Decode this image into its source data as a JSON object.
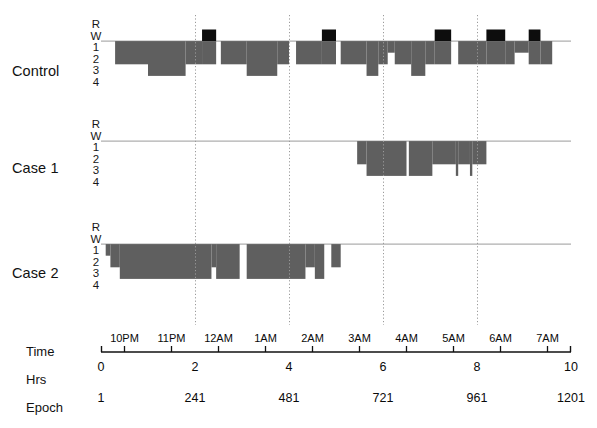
{
  "figure": {
    "title": "",
    "row_labels": [
      "Control",
      "Case 1",
      "Case 2"
    ],
    "y_tick_labels": [
      "R",
      "W",
      "1",
      "2",
      "3",
      "4"
    ],
    "axis_row_names": {
      "time": "Time",
      "hrs": "Hrs",
      "epoch": "Epoch"
    },
    "colors": {
      "sleep_fill": "#5f5f5f",
      "rem_fill": "#0d0d0d",
      "baseline": "#9a9a9a",
      "gridline": "#9a9a9a",
      "axis": "#111111",
      "background": "#ffffff"
    }
  },
  "chart_data": {
    "type": "area",
    "xlabel": "Hrs",
    "ylabel": "Sleep stage",
    "grid": true,
    "legend_position": "none",
    "xlim": [
      0,
      10
    ],
    "ylim_stages": [
      "R",
      "W",
      "1",
      "2",
      "3",
      "4"
    ],
    "stage_codes": {
      "R": "REM",
      "W": "Wake",
      "1": "Stage 1",
      "2": "Stage 2",
      "3": "Stage 3",
      "4": "Stage 4"
    },
    "x_axis": {
      "time_ticks": [
        "10PM",
        "11PM",
        "12AM",
        "1AM",
        "2AM",
        "3AM",
        "4AM",
        "5AM",
        "6AM",
        "7AM"
      ],
      "time_tick_hrs": [
        0.5,
        1.5,
        2.5,
        3.5,
        4.5,
        5.5,
        6.5,
        7.5,
        8.5,
        9.5
      ],
      "hrs_ticks": [
        0,
        2,
        4,
        6,
        8,
        10
      ],
      "hrs_tick_labels": [
        "0",
        "2",
        "4",
        "6",
        "8",
        "10"
      ],
      "epoch_ticks": [
        0,
        2,
        4,
        6,
        8,
        10
      ],
      "epoch_tick_labels": [
        "1",
        "241",
        "481",
        "721",
        "961",
        "1201"
      ],
      "gridline_hrs": [
        2,
        4,
        6,
        8
      ]
    },
    "series": [
      {
        "name": "Control",
        "segments": [
          {
            "start": 0.0,
            "end": 0.3,
            "stage": "W"
          },
          {
            "start": 0.3,
            "end": 1.0,
            "stage": "2"
          },
          {
            "start": 1.0,
            "end": 1.8,
            "stage": "3"
          },
          {
            "start": 1.8,
            "end": 2.15,
            "stage": "2"
          },
          {
            "start": 2.15,
            "end": 2.45,
            "stage": "R"
          },
          {
            "start": 2.45,
            "end": 2.55,
            "stage": "W"
          },
          {
            "start": 2.55,
            "end": 3.1,
            "stage": "2"
          },
          {
            "start": 3.1,
            "end": 3.75,
            "stage": "3"
          },
          {
            "start": 3.75,
            "end": 4.0,
            "stage": "2"
          },
          {
            "start": 4.0,
            "end": 4.15,
            "stage": "W"
          },
          {
            "start": 4.15,
            "end": 4.7,
            "stage": "2"
          },
          {
            "start": 4.7,
            "end": 5.0,
            "stage": "R"
          },
          {
            "start": 5.0,
            "end": 5.1,
            "stage": "W"
          },
          {
            "start": 5.1,
            "end": 5.65,
            "stage": "2"
          },
          {
            "start": 5.65,
            "end": 5.9,
            "stage": "3"
          },
          {
            "start": 5.9,
            "end": 6.1,
            "stage": "2"
          },
          {
            "start": 6.1,
            "end": 6.25,
            "stage": "1"
          },
          {
            "start": 6.25,
            "end": 6.6,
            "stage": "2"
          },
          {
            "start": 6.6,
            "end": 6.9,
            "stage": "3"
          },
          {
            "start": 6.9,
            "end": 7.1,
            "stage": "2"
          },
          {
            "start": 7.1,
            "end": 7.45,
            "stage": "R"
          },
          {
            "start": 7.45,
            "end": 7.6,
            "stage": "W"
          },
          {
            "start": 7.6,
            "end": 8.2,
            "stage": "2"
          },
          {
            "start": 8.2,
            "end": 8.6,
            "stage": "R"
          },
          {
            "start": 8.6,
            "end": 8.8,
            "stage": "2"
          },
          {
            "start": 8.8,
            "end": 9.1,
            "stage": "1"
          },
          {
            "start": 9.1,
            "end": 9.35,
            "stage": "R"
          },
          {
            "start": 9.35,
            "end": 9.6,
            "stage": "2"
          },
          {
            "start": 9.6,
            "end": 10.0,
            "stage": "W"
          }
        ]
      },
      {
        "name": "Case 1",
        "segments": [
          {
            "start": 0.0,
            "end": 5.45,
            "stage": "W"
          },
          {
            "start": 5.45,
            "end": 5.65,
            "stage": "2"
          },
          {
            "start": 5.65,
            "end": 6.5,
            "stage": "3"
          },
          {
            "start": 6.5,
            "end": 6.55,
            "stage": "W"
          },
          {
            "start": 6.55,
            "end": 7.05,
            "stage": "3"
          },
          {
            "start": 7.05,
            "end": 7.55,
            "stage": "2"
          },
          {
            "start": 7.55,
            "end": 7.6,
            "stage": "3"
          },
          {
            "start": 7.6,
            "end": 7.85,
            "stage": "2"
          },
          {
            "start": 7.85,
            "end": 7.9,
            "stage": "3"
          },
          {
            "start": 7.9,
            "end": 8.2,
            "stage": "2"
          },
          {
            "start": 8.2,
            "end": 10.0,
            "stage": "W"
          }
        ]
      },
      {
        "name": "Case 2",
        "segments": [
          {
            "start": 0.0,
            "end": 0.1,
            "stage": "W"
          },
          {
            "start": 0.1,
            "end": 0.2,
            "stage": "1"
          },
          {
            "start": 0.2,
            "end": 0.4,
            "stage": "2"
          },
          {
            "start": 0.4,
            "end": 2.35,
            "stage": "3"
          },
          {
            "start": 2.35,
            "end": 2.45,
            "stage": "2"
          },
          {
            "start": 2.45,
            "end": 2.95,
            "stage": "3"
          },
          {
            "start": 2.95,
            "end": 3.1,
            "stage": "W"
          },
          {
            "start": 3.1,
            "end": 4.35,
            "stage": "3"
          },
          {
            "start": 4.35,
            "end": 4.55,
            "stage": "2"
          },
          {
            "start": 4.55,
            "end": 4.75,
            "stage": "3"
          },
          {
            "start": 4.75,
            "end": 4.9,
            "stage": "W"
          },
          {
            "start": 4.9,
            "end": 5.1,
            "stage": "2"
          },
          {
            "start": 5.1,
            "end": 10.0,
            "stage": "W"
          }
        ]
      }
    ]
  }
}
